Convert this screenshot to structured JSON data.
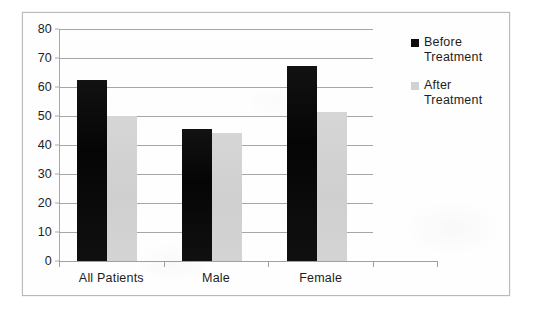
{
  "chart_data": {
    "type": "bar",
    "title": "",
    "subtitle": "",
    "xlabel": "",
    "ylabel": "",
    "categories": [
      "All Patients",
      "Male",
      "Female"
    ],
    "series": [
      {
        "name": "Before Treatment",
        "color": "#0d0d0d",
        "values": [
          62.3,
          45.5,
          67.2
        ]
      },
      {
        "name": "After Treatment",
        "color": "#d2d2d2",
        "values": [
          50.0,
          44.0,
          51.5
        ]
      }
    ],
    "ylim": [
      0,
      80
    ],
    "y_ticks": [
      0,
      10,
      20,
      30,
      40,
      50,
      60,
      70,
      80
    ],
    "y_tick_labels": [
      "0",
      "10",
      "20",
      "30",
      "40",
      "50",
      "60",
      "70",
      "80"
    ],
    "grid": true,
    "grid_axis": "y",
    "legend_position": "right"
  },
  "legend": {
    "entries": [
      {
        "label_line1": "Before",
        "label_line2": "Treatment",
        "swatch": "before-treatment-swatch",
        "color": "#0d0d0d"
      },
      {
        "label_line1": "After",
        "label_line2": "Treatment",
        "swatch": "after-treatment-swatch",
        "color": "#d2d2d2"
      }
    ]
  },
  "axes": {
    "x_categories": [
      "All Patients",
      "Male",
      "Female"
    ],
    "y_labels": [
      "80",
      "70",
      "60",
      "50",
      "40",
      "30",
      "20",
      "10",
      "0"
    ]
  },
  "colors": {
    "before": "#0d0d0d",
    "after": "#d2d2d2",
    "gridline": "#a6a6a6",
    "axis": "#a0a0a0",
    "frame_border": "#b9b9b9",
    "background": "#ffffff",
    "text": "#1d1d1d"
  }
}
